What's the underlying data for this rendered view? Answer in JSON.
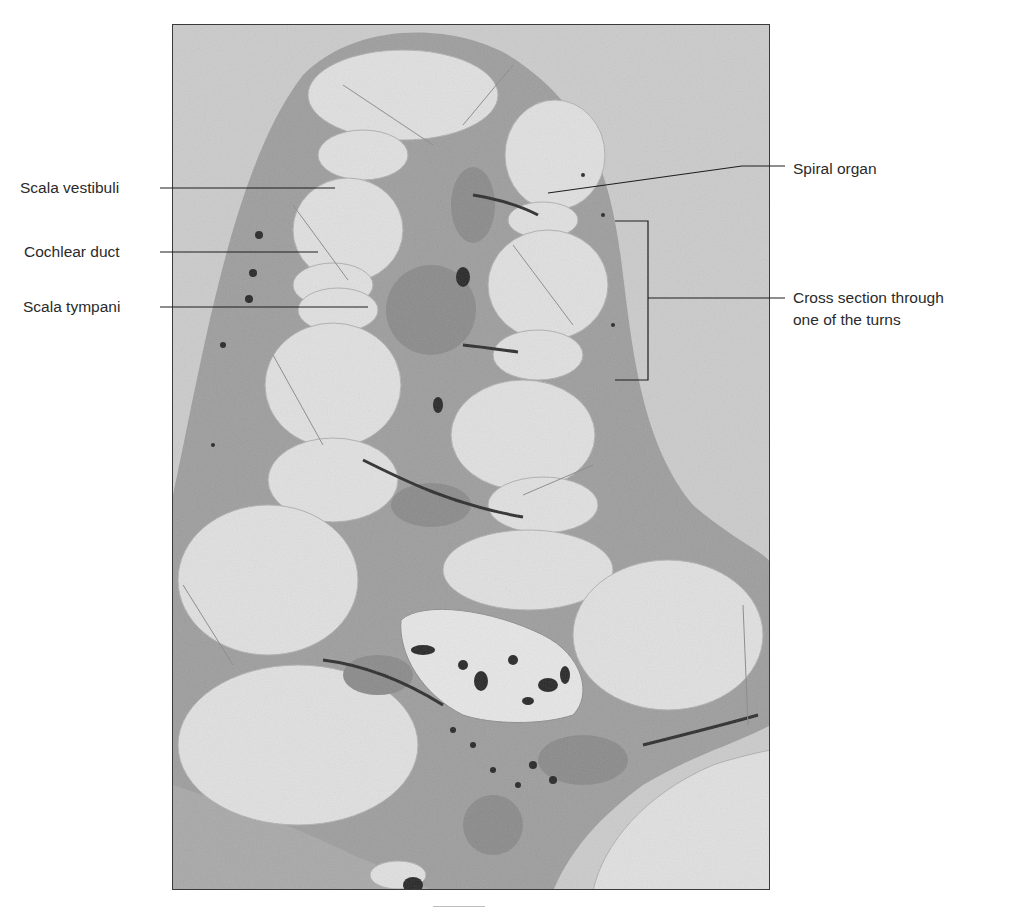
{
  "figure": {
    "labels_left": [
      {
        "text": "Scala vestibuli",
        "x": 20,
        "y": 180
      },
      {
        "text": "Cochlear duct",
        "x": 24,
        "y": 243
      },
      {
        "text": "Scala tympani",
        "x": 23,
        "y": 298
      }
    ],
    "labels_right": [
      {
        "text": "Spiral organ",
        "x": 793,
        "y": 160
      },
      {
        "text": "Cross section through",
        "x": 793,
        "y": 288
      },
      {
        "text": "one of the turns",
        "x": 793,
        "y": 310
      }
    ],
    "colors": {
      "background_tissue": "#c9c9c9",
      "bone": "#9a9a9a",
      "lumen": "#e2e2e2",
      "dark_cells": "#2a2a2a",
      "label_text": "#2a2a2a",
      "leader_line": "#1e1e1e"
    }
  }
}
